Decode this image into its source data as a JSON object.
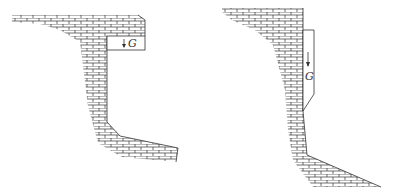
{
  "figures": [
    {
      "id": "left-wall",
      "description": "Retaining wall with top overhanging slab and curved base",
      "load_label": "G"
    },
    {
      "id": "right-wall",
      "description": "Retaining wall with triangular top and long sloped toe",
      "load_label": "G"
    }
  ],
  "colors": {
    "line": "#333333",
    "background": "#ffffff"
  }
}
